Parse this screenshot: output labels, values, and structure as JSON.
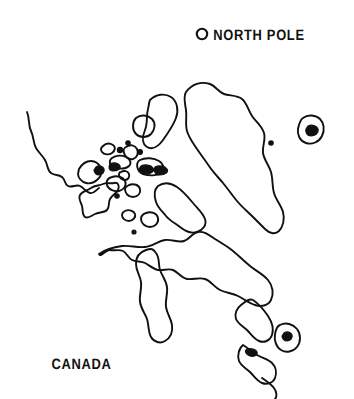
{
  "figure": {
    "kind": "line-art-map",
    "region": "Canadian Arctic Archipelago, Greenland and Canada",
    "background_color": "#ffffff",
    "ink_color": "#111111",
    "width": 354,
    "height": 399
  },
  "labels": {
    "north_pole": "NORTH POLE",
    "canada": "CANADA"
  },
  "markers": {
    "north_pole_symbol": "open-circle",
    "settlement_dots": 2
  },
  "map_data": {
    "type": "outline-map",
    "stroke_color": "#111111",
    "fill_color": "#ffffff",
    "islet_fill_color": "#111111",
    "landmasses": [
      "Greenland",
      "Ellesmere Island",
      "Baffin Island",
      "Victoria Island",
      "Banks Island",
      "Canadian mainland",
      "Newfoundland",
      "Iceland"
    ],
    "water_bodies": [
      "Hudson Bay",
      "Arctic Ocean",
      "Gulf of St. Lawrence"
    ]
  }
}
